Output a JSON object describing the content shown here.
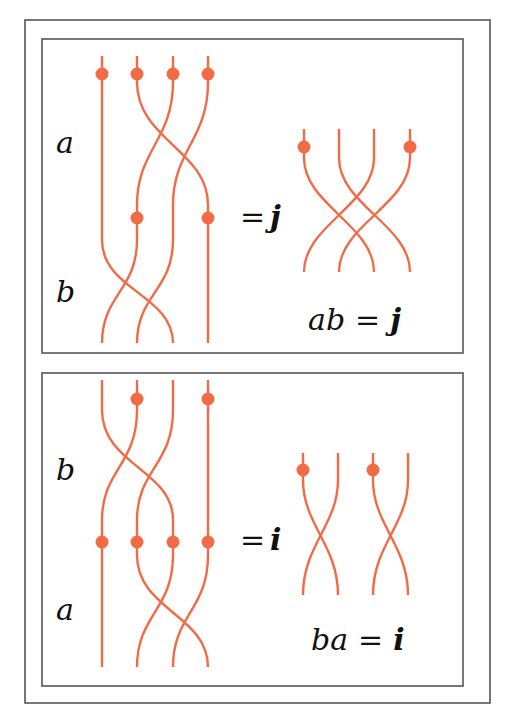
{
  "colors": {
    "strand": "#F26B47",
    "frame": "#555555"
  },
  "panels": [
    {
      "name": "panel-ab",
      "labels": {
        "upper": "a",
        "lower": "b"
      },
      "equals": "=",
      "result_symbol": "j",
      "equation": {
        "lhs": "ab",
        "eq": "=",
        "rhs": "j"
      }
    },
    {
      "name": "panel-ba",
      "labels": {
        "upper": "b",
        "lower": "a"
      },
      "equals": "=",
      "result_symbol": "i",
      "equation": {
        "lhs": "ba",
        "eq": "=",
        "rhs": "i"
      }
    }
  ]
}
